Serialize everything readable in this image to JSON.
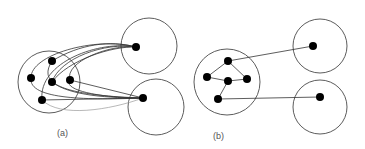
{
  "diagram": {
    "panels": [
      {
        "id": "a",
        "label": "(a)",
        "description": "Many edges from each node of the cluster to two remote nodes",
        "clusters": [
          {
            "name": "left-cluster",
            "cx": 49,
            "cy": 82,
            "r": 31
          },
          {
            "name": "top-right-cluster",
            "cx": 149,
            "cy": 46,
            "r": 28
          },
          {
            "name": "bottom-right-cluster",
            "cx": 156,
            "cy": 107,
            "r": 28
          }
        ],
        "nodes": [
          {
            "id": "a1",
            "x": 52,
            "y": 61
          },
          {
            "id": "a2",
            "x": 31,
            "y": 78
          },
          {
            "id": "a3",
            "x": 52,
            "y": 82
          },
          {
            "id": "a4",
            "x": 70,
            "y": 80
          },
          {
            "id": "a5",
            "x": 42,
            "y": 100
          },
          {
            "id": "aT",
            "x": 136,
            "y": 47
          },
          {
            "id": "aB",
            "x": 143,
            "y": 98
          }
        ]
      },
      {
        "id": "b",
        "label": "(b)",
        "description": "Cluster with internal edges and a single edge to each remote node",
        "clusters": [
          {
            "name": "left-cluster",
            "cx": 227,
            "cy": 82,
            "r": 33
          },
          {
            "name": "top-right-cluster",
            "cx": 320,
            "cy": 46,
            "r": 27
          },
          {
            "name": "bottom-right-cluster",
            "cx": 320,
            "cy": 107,
            "r": 27
          }
        ],
        "nodes": [
          {
            "id": "b1",
            "x": 228,
            "y": 61
          },
          {
            "id": "b2",
            "x": 207,
            "y": 77
          },
          {
            "id": "b3",
            "x": 228,
            "y": 81
          },
          {
            "id": "b4",
            "x": 247,
            "y": 79
          },
          {
            "id": "b5",
            "x": 218,
            "y": 99
          },
          {
            "id": "bT",
            "x": 313,
            "y": 46
          },
          {
            "id": "bB",
            "x": 320,
            "y": 97
          }
        ],
        "edges": [
          [
            "b1",
            "b2"
          ],
          [
            "b1",
            "b4"
          ],
          [
            "b2",
            "b3"
          ],
          [
            "b3",
            "b4"
          ],
          [
            "b3",
            "b5"
          ],
          [
            "b1",
            "bT"
          ],
          [
            "b5",
            "bB"
          ]
        ]
      }
    ],
    "colors": {
      "node": "#000000",
      "circle": "#4a4a4a",
      "edge": "#333333",
      "label": "#555555"
    }
  }
}
